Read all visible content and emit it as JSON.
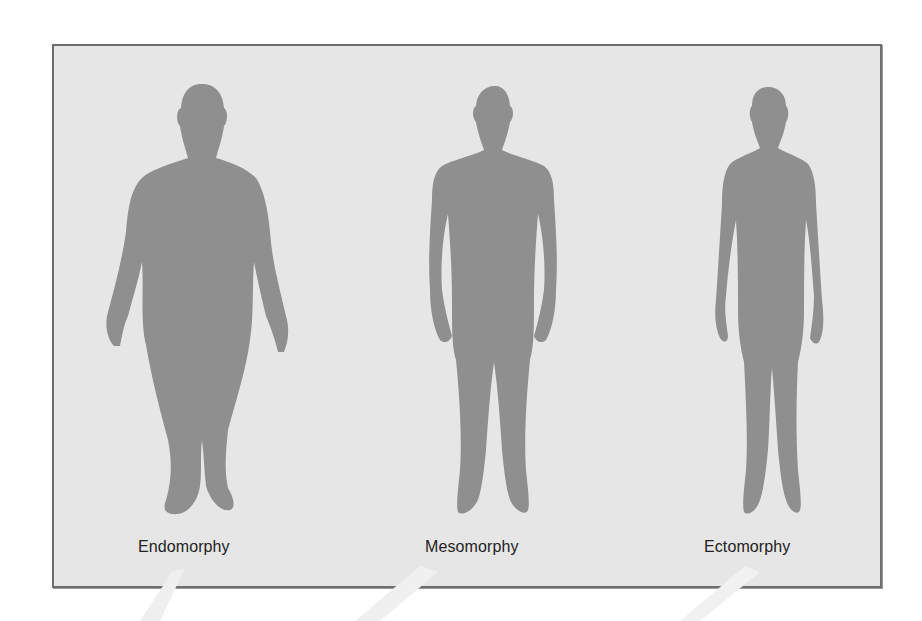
{
  "diagram": {
    "background_color": "#e6e6e6",
    "frame_color": "#6e6e6e",
    "silhouette_color": "#8f8f8f",
    "label_color": "#222222",
    "figures": [
      {
        "id": "endomorphy",
        "label": "Endomorphy",
        "description": "Heavy, rounded body type silhouette"
      },
      {
        "id": "mesomorphy",
        "label": "Mesomorphy",
        "description": "Muscular, medium body type silhouette"
      },
      {
        "id": "ectomorphy",
        "label": "Ectomorphy",
        "description": "Thin, lean body type silhouette"
      }
    ]
  }
}
